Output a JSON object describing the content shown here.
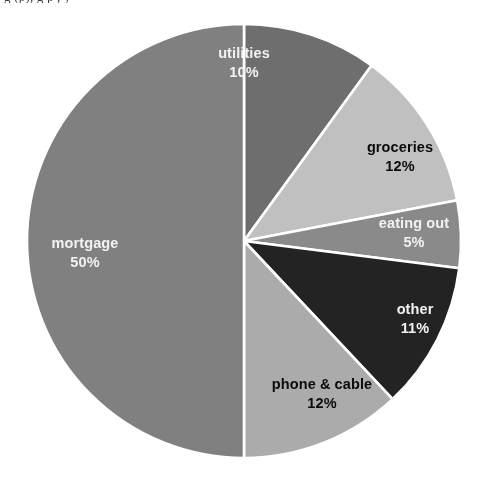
{
  "figure": {
    "cropped_caption_fragment": "g  (p),  g   p     ,     y",
    "background_color": "#ffffff",
    "separator_color": "#ffffff"
  },
  "chart_data": {
    "type": "pie",
    "title": "",
    "subtitle": "",
    "xlabel": "",
    "ylabel": "",
    "legend_position": "none",
    "grid": false,
    "start_angle_deg": 0,
    "direction": "clockwise",
    "value_unit": "percent",
    "categories": [
      "utilities",
      "groceries",
      "eating out",
      "other",
      "phone & cable",
      "mortgage"
    ],
    "values": [
      10,
      12,
      5,
      11,
      12,
      50
    ],
    "labels": [
      "10%",
      "12%",
      "5%",
      "11%",
      "12%",
      "50%"
    ],
    "colors": [
      "#6e6e6e",
      "#c0c0c0",
      "#8a8a8a",
      "#232323",
      "#ababab",
      "#808080"
    ],
    "slices": [
      {
        "name": "utilities",
        "value": 10,
        "label": "utilities",
        "percent_label": "10%",
        "color": "#6e6e6e",
        "label_color": "#f2f2f2",
        "label_style": "on-dark",
        "start_angle_deg": 0,
        "end_angle_deg": 36
      },
      {
        "name": "groceries",
        "value": 12,
        "label": "groceries",
        "percent_label": "12%",
        "color": "#c0c0c0",
        "label_color": "#0b0b0b",
        "label_style": "on-light",
        "start_angle_deg": 36,
        "end_angle_deg": 79.2
      },
      {
        "name": "eating out",
        "value": 5,
        "label": "eating out",
        "percent_label": "5%",
        "color": "#8a8a8a",
        "label_color": "#f2f2f2",
        "label_style": "on-dark",
        "start_angle_deg": 79.2,
        "end_angle_deg": 97.2
      },
      {
        "name": "other",
        "value": 11,
        "label": "other",
        "percent_label": "11%",
        "color": "#232323",
        "label_color": "#f2f2f2",
        "label_style": "on-dark",
        "start_angle_deg": 97.2,
        "end_angle_deg": 136.8
      },
      {
        "name": "phone & cable",
        "value": 12,
        "label": "phone & cable",
        "percent_label": "12%",
        "color": "#ababab",
        "label_color": "#0b0b0b",
        "label_style": "on-light",
        "start_angle_deg": 136.8,
        "end_angle_deg": 180
      },
      {
        "name": "mortgage",
        "value": 50,
        "label": "mortgage",
        "percent_label": "50%",
        "color": "#808080",
        "label_color": "#f2f2f2",
        "label_style": "on-dark",
        "start_angle_deg": 180,
        "end_angle_deg": 360
      }
    ],
    "total": 100
  }
}
